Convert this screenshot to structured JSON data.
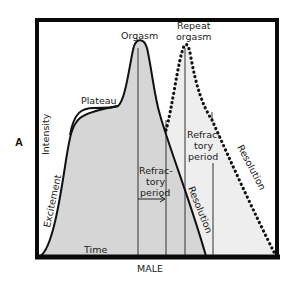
{
  "figure": {
    "panel_label": "A",
    "caption": "MALE",
    "axis": {
      "y_label": "Intensity",
      "x_label": "Time"
    },
    "phases": {
      "excitement": "Excitement",
      "plateau": "Plateau",
      "orgasm": "Orgasm",
      "repeat_orgasm_line1": "Repeat",
      "repeat_orgasm_line2": "orgasm",
      "refractory1_line1": "Refrac-",
      "refractory1_line2": "tory",
      "refractory1_line3": "period",
      "refractory2_line1": "Refrac-",
      "refractory2_line2": "tory",
      "refractory2_line3": "period",
      "resolution1": "Resolution",
      "resolution2": "Resolution"
    },
    "colors": {
      "fill": "#d6d6d6",
      "line": "#111111",
      "frame": "#0a0a0a",
      "background": "#ffffff"
    }
  }
}
